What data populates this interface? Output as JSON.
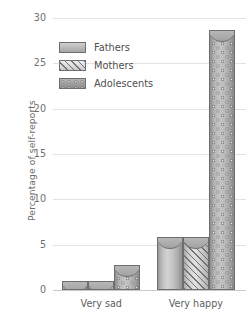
{
  "chart_data": {
    "type": "bar",
    "title": "",
    "xlabel": "",
    "ylabel": "Percentage of self-reports",
    "categories": [
      "Very sad",
      "Very happy"
    ],
    "series": [
      {
        "name": "Fathers",
        "values": [
          1.0,
          5.8
        ]
      },
      {
        "name": "Mothers",
        "values": [
          1.0,
          5.8
        ]
      },
      {
        "name": "Adolescents",
        "values": [
          2.8,
          28.7
        ]
      }
    ],
    "ylim": [
      0,
      30
    ],
    "yticks": [
      0,
      5,
      10,
      15,
      20,
      25,
      30
    ],
    "ytick_labels": [
      "0",
      "5",
      "10",
      "15",
      "20",
      "25",
      "30"
    ],
    "grid": true,
    "legend_position": "upper-left-inside",
    "colors": {
      "fathers": "#bdbdbd",
      "mothers": "#d4d4d4",
      "adolescents": "#ababab",
      "gridline": "#e3e3e3",
      "axis": "#c9c9c9",
      "text": "#5a5a5a",
      "background": "#ffffff"
    }
  },
  "legend": {
    "items": [
      {
        "label": "Fathers"
      },
      {
        "label": "Mothers"
      },
      {
        "label": "Adolescents"
      }
    ]
  }
}
